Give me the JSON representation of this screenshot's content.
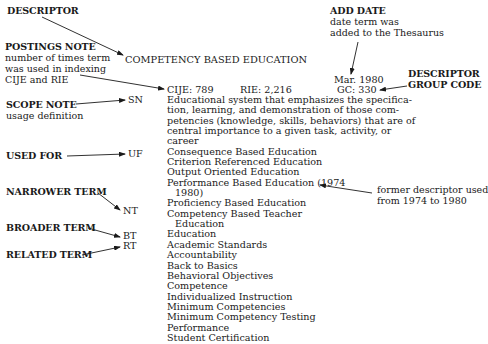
{
  "labels": {
    "descriptor": {
      "title": "DESCRIPTOR"
    },
    "postings_note": {
      "title": "POSTINGS NOTE",
      "desc": [
        "number of times term",
        "was used in indexing",
        "CIJE and RIE"
      ]
    },
    "scope_note": {
      "title": "SCOPE NOTE",
      "desc": "usage definition"
    },
    "used_for": {
      "title": "USED FOR"
    },
    "narrower_term": {
      "title": "NARROWER TERM"
    },
    "broader_term": {
      "title": "BROADER TERM"
    },
    "related_term": {
      "title": "RELATED TERM"
    },
    "add_date": {
      "title": "ADD DATE",
      "desc": [
        "date term was",
        "added to the Thesaurus"
      ]
    },
    "group_code": {
      "title": [
        "DESCRIPTOR",
        "GROUP CODE"
      ]
    },
    "former": {
      "desc": [
        "former descriptor used",
        "from 1974 to 1980"
      ]
    }
  },
  "codes": {
    "sn": "SN",
    "uf": "UF",
    "nt": "NT",
    "bt": "BT",
    "rt": "RT"
  },
  "entry": {
    "descriptor": "COMPETENCY BASED EDUCATION",
    "add_date": "Mar. 1980",
    "cije": "CIJE:  789",
    "rie": "RIE:  2,216",
    "gc": "GC:  330",
    "scope_note": [
      "Educational system that emphasizes the specifica-",
      "tion, learning, and demonstration of those com-",
      "petencies (knowledge, skills, behaviors) that are of",
      "central importance to a given task, activity, or",
      "career"
    ],
    "used_for": [
      "Consequence Based Education",
      "Criterion Referenced Education",
      "Output Oriented Education",
      "Performance Based Education (1974",
      "1980)"
    ],
    "narrower_terms": [
      "Proficiency Based Education",
      "Competency Based Teacher",
      "Education"
    ],
    "broader_terms": [
      "Education"
    ],
    "related_terms": [
      "Academic Standards",
      "Accountability",
      "Back to Basics",
      "Behavioral Objectives",
      "Competence",
      "Individualized Instruction",
      "Minimum Competencies",
      "Minimum Competency Testing",
      "Performance",
      "Student Certification"
    ]
  }
}
